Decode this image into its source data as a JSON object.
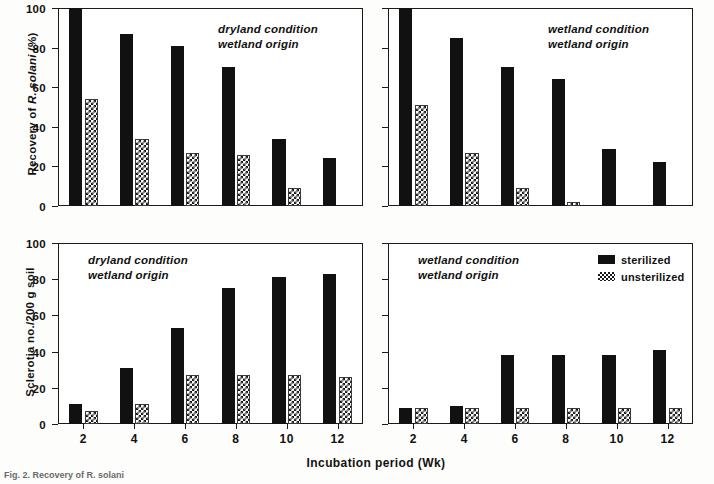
{
  "figure": {
    "xlabel": "Incubation period (Wk)",
    "caption": "Fig. 2. Recovery of R. solani",
    "categories": [
      "2",
      "4",
      "6",
      "8",
      "10",
      "12"
    ],
    "legend": {
      "items": [
        {
          "label": "sterilized",
          "pattern": "solid-black",
          "color": "#111111"
        },
        {
          "label": "unsterilized",
          "pattern": "checkered",
          "color": "#1a1a1a"
        }
      ]
    }
  },
  "chart_data": [
    {
      "id": "top-left",
      "type": "bar",
      "title": "",
      "annotation": [
        "dryland condition",
        "wetland origin"
      ],
      "xlabel": "",
      "ylabel": "Recovery of R. solani (%)",
      "categories": [
        "2",
        "4",
        "6",
        "8",
        "10",
        "12"
      ],
      "xticklabels": [
        "2",
        "4",
        "6",
        "8",
        "10",
        "12"
      ],
      "yticklabels": [
        "0",
        "20",
        "40",
        "60",
        "80",
        "100"
      ],
      "ylim": [
        0,
        100
      ],
      "yticks": [
        0,
        20,
        40,
        60,
        80,
        100
      ],
      "grid": false,
      "series": [
        {
          "name": "sterilized",
          "values": [
            100,
            87,
            81,
            70,
            34,
            24
          ]
        },
        {
          "name": "unsterilized",
          "values": [
            54,
            34,
            27,
            26,
            9,
            0
          ]
        }
      ]
    },
    {
      "id": "top-right",
      "type": "bar",
      "title": "",
      "annotation": [
        "wetland condition",
        "wetland origin"
      ],
      "xlabel": "",
      "ylabel": "",
      "categories": [
        "2",
        "4",
        "6",
        "8",
        "10",
        "12"
      ],
      "xticklabels": [
        "2",
        "4",
        "6",
        "8",
        "10",
        "12"
      ],
      "yticklabels": [
        "",
        "",
        "",
        "",
        "",
        ""
      ],
      "ylim": [
        0,
        100
      ],
      "yticks": [
        0,
        20,
        40,
        60,
        80,
        100
      ],
      "grid": false,
      "series": [
        {
          "name": "sterilized",
          "values": [
            100,
            85,
            70,
            64,
            29,
            22
          ]
        },
        {
          "name": "unsterilized",
          "values": [
            51,
            27,
            9,
            2,
            0,
            0
          ]
        }
      ]
    },
    {
      "id": "bottom-left",
      "type": "bar",
      "title": "",
      "annotation": [
        "dryland condition",
        "wetland origin"
      ],
      "xlabel": "Incubation period (Wk)",
      "ylabel": "Sclerotia no./200 g soil",
      "categories": [
        "2",
        "4",
        "6",
        "8",
        "10",
        "12"
      ],
      "xticklabels": [
        "2",
        "4",
        "6",
        "8",
        "10",
        "12"
      ],
      "yticklabels": [
        "0",
        "20",
        "40",
        "60",
        "80",
        "100"
      ],
      "ylim": [
        0,
        100
      ],
      "yticks": [
        0,
        20,
        40,
        60,
        80,
        100
      ],
      "grid": false,
      "series": [
        {
          "name": "sterilized",
          "values": [
            11,
            31,
            53,
            75,
            81,
            83
          ]
        },
        {
          "name": "unsterilized",
          "values": [
            7,
            11,
            27,
            27,
            27,
            26
          ]
        }
      ]
    },
    {
      "id": "bottom-right",
      "type": "bar",
      "title": "",
      "annotation": [
        "wetland condition",
        "wetland origin"
      ],
      "xlabel": "Incubation period (Wk)",
      "ylabel": "",
      "categories": [
        "2",
        "4",
        "6",
        "8",
        "10",
        "12"
      ],
      "xticklabels": [
        "2",
        "4",
        "6",
        "8",
        "10",
        "12"
      ],
      "yticklabels": [
        "",
        "",
        "",
        "",
        "",
        ""
      ],
      "ylim": [
        0,
        100
      ],
      "yticks": [
        0,
        20,
        40,
        60,
        80,
        100
      ],
      "grid": false,
      "series": [
        {
          "name": "sterilized",
          "values": [
            9,
            10,
            38,
            38,
            38,
            41
          ]
        },
        {
          "name": "unsterilized",
          "values": [
            9,
            9,
            9,
            9,
            9,
            9
          ]
        }
      ]
    }
  ]
}
